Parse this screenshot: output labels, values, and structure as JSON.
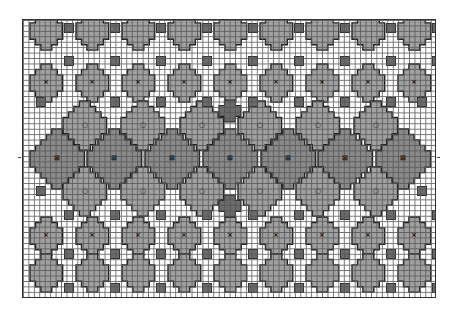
{
  "chart": {
    "title": "",
    "cols": 76,
    "rows": 51,
    "cell_px": 5.45,
    "colors": {
      "background": "#ffffff",
      "grid_line": "#555555",
      "motif_fill": "#a0a0a0",
      "motif_outline": "#222222",
      "dark_square": "#6b6b6b",
      "center_motif_fill": "#8a8a8a"
    },
    "legend": {
      "x_symbol": "×",
      "circle_symbol": "○",
      "boxed_x_symbol": "⊠"
    },
    "rows_of_motifs": [
      {
        "name": "top-plain-row",
        "y": 30,
        "size": "small",
        "symbol": "",
        "x": [
          45,
          91,
          137,
          183,
          229,
          275,
          321,
          367,
          413
        ]
      },
      {
        "name": "x-row-upper",
        "y": 82,
        "size": "small",
        "symbol": "×",
        "x": [
          45,
          91,
          137,
          183,
          229,
          275,
          321,
          367,
          413
        ]
      },
      {
        "name": "circle-row-upper",
        "y": 125,
        "size": "medium",
        "symbol": "○",
        "x": [
          84,
          142,
          201,
          259,
          317,
          375
        ]
      },
      {
        "name": "boxed-x-center-row",
        "y": 158,
        "size": "large",
        "symbol": "⊠",
        "x": [
          56,
          113,
          171,
          229,
          287,
          344,
          402
        ]
      },
      {
        "name": "circle-row-lower",
        "y": 191,
        "size": "medium",
        "symbol": "○",
        "x": [
          84,
          142,
          201,
          259,
          317,
          375
        ]
      },
      {
        "name": "x-row-lower",
        "y": 235,
        "size": "small",
        "symbol": "×",
        "x": [
          45,
          91,
          137,
          183,
          229,
          275,
          321,
          367,
          413
        ]
      },
      {
        "name": "bottom-plain-row",
        "y": 272,
        "size": "small",
        "symbol": "",
        "x": [
          45,
          91,
          137,
          183,
          229,
          275,
          321,
          367,
          413
        ]
      }
    ],
    "dark_squares": [
      {
        "y": 27,
        "x": [
          68,
          114,
          160,
          206,
          252,
          298,
          344,
          390,
          436
        ]
      },
      {
        "y": 60,
        "x": [
          68,
          114,
          160,
          206,
          252,
          298,
          344,
          390,
          436
        ]
      },
      {
        "y": 101,
        "x": [
          40,
          114,
          160,
          206,
          252,
          298,
          344,
          390,
          421
        ]
      },
      {
        "y": 190,
        "x": [
          40,
          421
        ]
      },
      {
        "y": 214,
        "x": [
          68,
          114,
          160,
          206,
          252,
          298,
          344,
          390,
          436
        ]
      },
      {
        "y": 253,
        "x": [
          68,
          114,
          160,
          206,
          252,
          298,
          344,
          390,
          436
        ]
      },
      {
        "y": 287,
        "x": [
          68,
          114,
          160,
          206,
          252,
          298,
          344,
          390,
          436
        ]
      }
    ],
    "center_crosses": [
      {
        "x": 229,
        "y": 110
      },
      {
        "x": 229,
        "y": 205
      }
    ],
    "side_ticks": {
      "y": 157
    }
  }
}
